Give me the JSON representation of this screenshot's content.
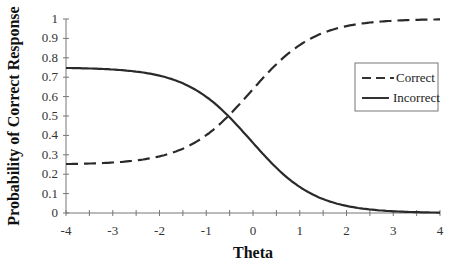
{
  "chart_data": {
    "type": "line",
    "title": "",
    "xlabel": "Theta",
    "ylabel": "Probability of Correct Response",
    "xlim": [
      -4,
      4
    ],
    "ylim": [
      0,
      1
    ],
    "x_ticks": [
      "-4",
      "-3",
      "-2",
      "-1",
      "0",
      "1",
      "2",
      "3",
      "4"
    ],
    "y_ticks": [
      "0",
      "0.1",
      "0.2",
      "0.3",
      "0.4",
      "0.5",
      "0.6",
      "0.7",
      "0.8",
      "0.9",
      "1"
    ],
    "grid": false,
    "legend_position": "right",
    "x": [
      -4,
      -3.5,
      -3,
      -2.5,
      -2,
      -1.5,
      -1,
      -0.5,
      0,
      0.5,
      1,
      1.5,
      2,
      2.5,
      3,
      3.5,
      4
    ],
    "series": [
      {
        "name": "Correct",
        "style": "dashed",
        "values": [
          0.25,
          0.255,
          0.26,
          0.27,
          0.29,
          0.33,
          0.4,
          0.5,
          0.61,
          0.73,
          0.84,
          0.91,
          0.95,
          0.97,
          0.98,
          0.99,
          0.99
        ]
      },
      {
        "name": "Incorrect",
        "style": "solid",
        "values": [
          0.75,
          0.745,
          0.74,
          0.73,
          0.71,
          0.67,
          0.6,
          0.5,
          0.39,
          0.27,
          0.16,
          0.09,
          0.05,
          0.03,
          0.02,
          0.01,
          0.01
        ]
      }
    ]
  },
  "legend": {
    "items": [
      {
        "label": "Correct"
      },
      {
        "label": "Incorrect"
      }
    ]
  },
  "axes": {
    "xlabel": "Theta",
    "ylabel": "Probability of Correct Response"
  }
}
